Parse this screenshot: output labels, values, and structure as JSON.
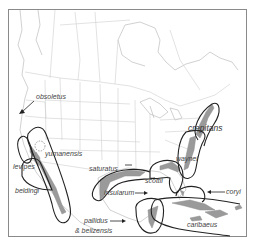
{
  "map": {
    "title": "",
    "region": "North America, Central America and Caribbean",
    "colors": {
      "range_fill": "#9a9a9a",
      "outline": "#222222",
      "borders": "#cfcfcf",
      "frame": "#8a8a8a",
      "label_text": "#444444"
    },
    "labels": [
      {
        "id": "obsoletus",
        "text": "obsoletus"
      },
      {
        "id": "yumanensis",
        "text": "yumanensis"
      },
      {
        "id": "levipes",
        "text": "levipes"
      },
      {
        "id": "beldingi",
        "text": "beldingi"
      },
      {
        "id": "saturatus",
        "text": "saturatus"
      },
      {
        "id": "crepitans",
        "text": "crepitans"
      },
      {
        "id": "waynei",
        "text": "waynei"
      },
      {
        "id": "scottii",
        "text": "scottii"
      },
      {
        "id": "insularum",
        "text": "insularum"
      },
      {
        "id": "coryi",
        "text": "coryi"
      },
      {
        "id": "pallidus",
        "text": "pallidus"
      },
      {
        "id": "belizensis",
        "text": "& belizensis"
      },
      {
        "id": "caribaeus",
        "text": "caribaeus"
      }
    ]
  }
}
